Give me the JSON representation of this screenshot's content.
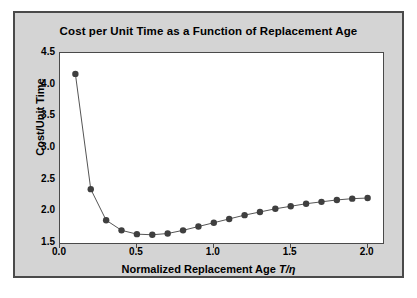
{
  "figure": {
    "panel_background": "#d4d4d4",
    "panel_border": "#4a4a4a",
    "plot_background": "#ffffff"
  },
  "chart_data": {
    "type": "line",
    "title": "Cost per Unit Time as a Function of Replacement Age",
    "xlabel": "Normalized Replacement Age T/η",
    "xlabel_prefix": "Normalized Replacement Age ",
    "xlabel_symbol": "T/η",
    "ylabel": "Cost/Unit Time",
    "xlim": [
      0.0,
      2.1
    ],
    "ylim": [
      1.5,
      4.5
    ],
    "xticks": [
      0.0,
      0.5,
      1.0,
      1.5,
      2.0
    ],
    "xticklabels": [
      "0.0",
      "0.5",
      "1.0",
      "1.5",
      "2.0"
    ],
    "yticks": [
      1.5,
      2.0,
      2.5,
      3.0,
      3.5,
      4.0,
      4.5
    ],
    "yticklabels": [
      "1.5",
      "2.0",
      "2.5",
      "3.0",
      "3.5",
      "4.0",
      "4.5"
    ],
    "grid": false,
    "legend": false,
    "marker": "filled-circle",
    "marker_color": "#3f3f3f",
    "line_color": "#555555",
    "line_width": 1.0,
    "marker_size": 3.2,
    "x": [
      0.1,
      0.2,
      0.3,
      0.4,
      0.5,
      0.6,
      0.7,
      0.8,
      0.9,
      1.0,
      1.1,
      1.2,
      1.3,
      1.4,
      1.5,
      1.6,
      1.7,
      1.8,
      1.9,
      2.0
    ],
    "values": [
      4.17,
      2.35,
      1.86,
      1.7,
      1.64,
      1.63,
      1.65,
      1.7,
      1.76,
      1.82,
      1.88,
      1.94,
      1.99,
      2.04,
      2.08,
      2.12,
      2.15,
      2.18,
      2.2,
      2.21
    ],
    "series": [
      {
        "name": "Cost per unit time",
        "values": [
          4.17,
          2.35,
          1.86,
          1.7,
          1.64,
          1.63,
          1.65,
          1.7,
          1.76,
          1.82,
          1.88,
          1.94,
          1.99,
          2.04,
          2.08,
          2.12,
          2.15,
          2.18,
          2.2,
          2.21
        ]
      }
    ]
  }
}
